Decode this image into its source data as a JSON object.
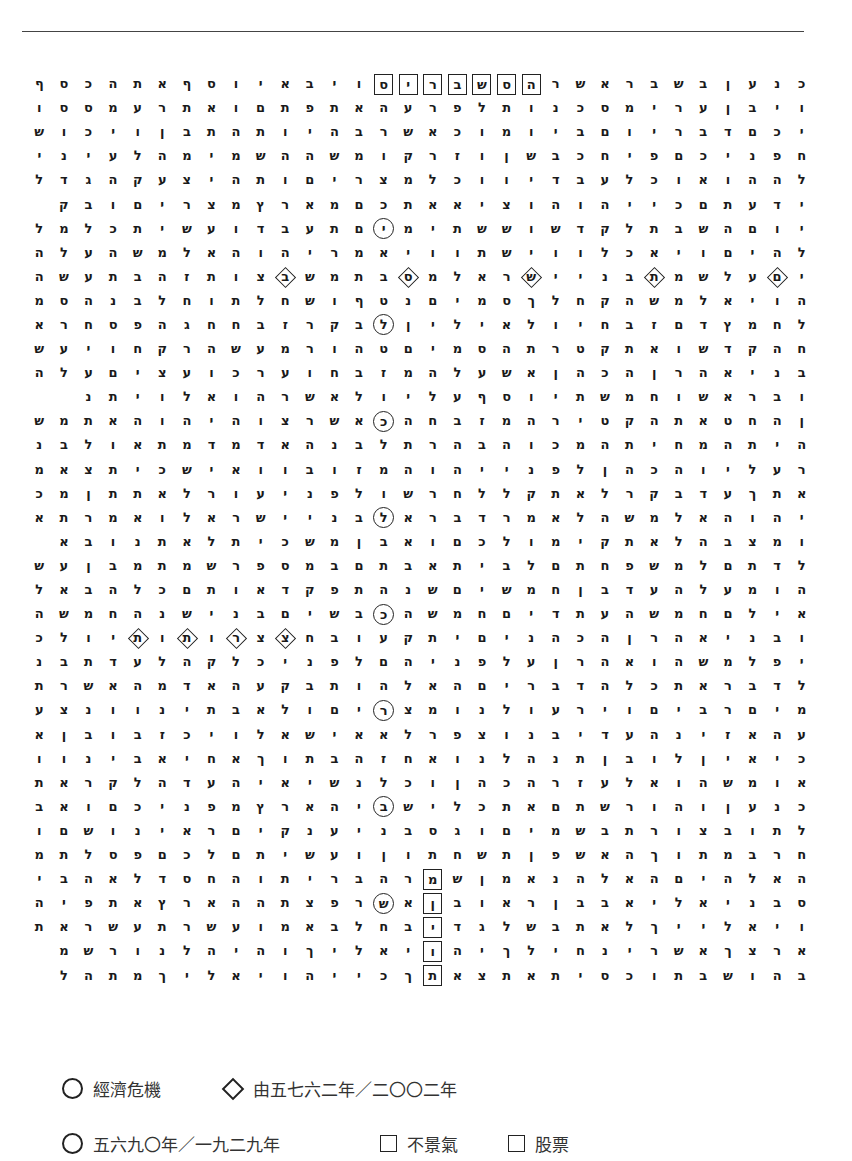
{
  "matrix": {
    "columns": 32,
    "notation": "rows listed right-to-left; [x]=boxed, (x)=circled, <x>=diamond",
    "rows": [
      "כ נ ע ן ב ש ב ר א ש ר [ה] [ס] [ש] [ב] [ר] [י] [ס] ו י ב א י ו ס ף א ת ה כ ס ף",
      "ו י ב ן ע ר י מ ס כ נ ו ת ל פ ר ע ה א ת פ ת ם ו א ת ר ע מ ס ס ו",
      "י כ ם ד ב ר י ו ם ב י ו מ ו כ א ש ר ב ה י ו ת ה ת ב ן ו י כ ו ש",
      "ח פ נ י כ ם פ י ח כ ב ש ן ו ז ר ק ו מ ש ה ה ש מ י מ ה ל ע י נ י",
      "ל ה ה ו א ו כ ל ע ב ד י ו ו כ ל מ צ ר י ם ו ת ה י צ ע ק ה ג ד ל",
      "י ד ע ת ם כ י י ה ו ה ו צ י א א ת כ ם מ א ר ץ מ צ ר י ם ו ב ק",
      "י ו ם ה ש ב ת ל ק ד ש ו ש ש ת י מ (י) ם ת ע ב ד ו ע ש י ת כ ל מ ל",
      "ל ה י ם ו י א כ ל ו ו י ש ת ו ו י א מ ר י ה ו ה א ל מ ש ה ע ל ה",
      "י <ם> ע ל ש מ <ת> ב נ י י <ש> ר א ל מ <ס> ב ת מ ש <ב> צ ו ת ז ה ב ת ע ש ה",
      "ה ו י א ל מ ש ה ק ח ל ך ס מ י ם נ ט ף ו ש ח ל ת ו ח ל ב נ ה ס מ",
      "ל ח מ ץ ד ם ז ב ח י ו ל א י ל י ן (ל) ב ק ר ז ב ח ח ג ה פ ס ח ר א",
      "ח ה ק ד ש ו א ת ק ט ר ת ה ס מ י ם ט ה ו ר מ ע ש ה ר ק ח ו י ע ש",
      "ב נ י א ה ר ן ה כ ה ן א ש ע ל ה מ ז ב ח ו ע ר כ ו ע צ י ם ע ל ה",
      "ו ב ר א ש ו ח מ ש ת י ו ס ף ע ל י ו ל א ש ר ה ו א ל ו י ת נ",
      "ן ה ח ט א ת ה ק ט י ר ה מ ז ב ח ה (כ) א ש ר צ ו ה י ה ו ה א ת מ ש",
      "ה י ת ה מ ח י ת ה מ כ ו ה ב ה ר ת ל ב נ ה א ד מ ד מ ת א ו ל ב נ",
      "ר ע ל י ו ה כ ה ן ל פ נ י י ה ו ה מ ז ו ב ו ו א י ש כ י ת צ א מ",
      "א ת ך ע ד ב ק ר ל א ת ק ל ל ח ר ש ו ל פ נ י ע ו ר ל א ת ת ן מ כ",
      "י ה ו ה א ל מ ש ה ל א מ ר ד ב ר א (ל) ב נ י י ש ר א ל ו א מ ר ת א",
      "ו מ צ ב ה ל א ת ק י מ ו ל כ ם ו א ב ן מ ש כ י ת ל א ת נ ו ב א",
      "ל ד ת ם ל מ ש פ ח ת ם ל ב י ת א ב ת ם ב מ ס פ ר ש מ ת מ ב ן ע ש",
      "ה ו מ ע ל ה ע ד ב ן ח מ ש י ם ש נ ה ת פ ק ד א ו ת ם כ ל ה ב א ל",
      "א י ל ם ח מ ש ה ע ת ד י ם ח מ ש ה (כ) ב ש י ם ב נ י ש נ ה ח מ ש ה",
      "ו ב נ י א ה ר ן ה כ ה נ י ם י ת ק ע ו ב ח <צ> צ <ר> ו <ת> ו <ת> י ו ל כ",
      "י פ ל מ ש ה ו א ה ר ן ע ל פ נ י ה ם ל פ נ י כ ל ק ה ל ע ד ת ב נ",
      "ל ד ב ר א ת כ ל ה ד ב ר י ם ה א ל ה ו ת ב ק ע ה א ד מ ה א ש ר ת",
      "מ י ם ר ב י ם ו י ר ע ו ל נ ו מ צ (ר) י ם ו ל א ב ת י נ ו ו נ צ ע",
      "ע ה א ז י נ ה ע ד י ב נ ו צ פ ר ל א א י ש א ל ו י כ ז ב ו ב ן א",
      "כ י א י ן ל ו ב ן ת נ ה ל נ ו א ח ז ה ב ת ו ך א ח י א ב י נ ו ו",
      "א ו מ ש ה ו א ל ע ז ר ה כ ה ן ו כ ל נ ש י א י ה ע ד ה ל ק ר א ת",
      "כ נ ע ן ו ה ו ר ש ת ם א ת כ ל י ש (ב) י ה א ר ץ מ פ נ י כ ם ו א ב",
      "ל ת ו ב צ ו ר ת ב ש מ י ם ו ג ס ב נ י ע נ ק י ם ר א י נ ו ש ם ו",
      "ח ר ב מ ת ו ך ה א ש פ ן ת ש ח ת ו ן ו ע ש י ת ם ל כ ם פ ס ל ת מ",
      "ה א ל ה י ם ה א ל ה נ א מ ן ש [מ] ר ה ב ר י ת ו ה ח ס ד ל א ה ב י",
      "ס ב נ י א ל י א ב ב ן ר א ו ב [ן] א (ש) ר פ צ ת ה ה א ר ץ א ת פ י ה",
      "ו י א ל י י ך ל א ת ב ש ל ג ד [י] ב ח ל ב א מ ו ע ש ר ת ע ש ר א ת",
      "א ר צ ך א ש ר י נ ח י ל ך י ה [ו] י א ל י ך ו ה י ה ל נ ו ר ש מ",
      "ב ה ו ש ב ת ו כ ס י ת א ת צ א [ת] ך כ י י ה ו י א ל י ך מ ת ה ל"
    ]
  },
  "legend": {
    "row1": [
      {
        "symbol": "circle",
        "label": "經濟危機"
      },
      {
        "symbol": "diamond",
        "label": "由五七六二年／二〇〇二年"
      }
    ],
    "row2": [
      {
        "symbol": "circle",
        "label": "五六九〇年／一九二九年"
      },
      {
        "symbol": "box",
        "label": "不景氣"
      },
      {
        "symbol": "box",
        "label": "股票"
      }
    ]
  }
}
